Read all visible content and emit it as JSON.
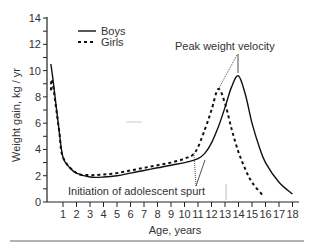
{
  "chart_data": {
    "type": "line",
    "title": "",
    "xlabel": "Age, years",
    "ylabel": "Weight gain, kg / yr",
    "xlim": [
      0,
      18
    ],
    "ylim": [
      0,
      14
    ],
    "x_ticks": [
      "1",
      "2",
      "3",
      "4",
      "5",
      "6",
      "7",
      "8",
      "9",
      "10",
      "11",
      "12",
      "13",
      "14",
      "15",
      "16",
      "17",
      "18"
    ],
    "y_ticks": [
      "0",
      "2",
      "4",
      "6",
      "8",
      "10",
      "12",
      "14"
    ],
    "grid": false,
    "legend_position": "upper-left",
    "series": [
      {
        "name": "Boys",
        "style": "solid",
        "color": "#111111",
        "x": [
          0.1,
          0.3,
          0.7,
          1,
          1.5,
          2,
          3,
          4,
          5,
          6,
          7,
          8,
          9,
          10,
          11,
          11.5,
          12,
          12.5,
          13,
          13.5,
          14,
          14.5,
          15,
          15.5,
          16,
          17,
          18
        ],
        "y": [
          10.5,
          9.0,
          5.5,
          3.4,
          2.6,
          2.2,
          1.9,
          1.9,
          2.0,
          2.2,
          2.4,
          2.6,
          2.8,
          3.0,
          3.3,
          3.7,
          4.5,
          5.7,
          7.2,
          8.8,
          9.6,
          8.2,
          6.0,
          4.3,
          3.0,
          1.5,
          0.6
        ]
      },
      {
        "name": "Girls",
        "style": "dashed",
        "color": "#111111",
        "x": [
          0.1,
          0.2,
          0.7,
          1,
          2,
          3,
          4,
          5,
          6,
          7,
          8,
          9,
          10,
          10.8,
          11.5,
          12,
          12.5,
          13,
          13.5,
          14,
          14.5,
          15,
          15.8
        ],
        "y": [
          8.5,
          9.2,
          5.5,
          3.4,
          2.2,
          2.05,
          2.1,
          2.2,
          2.4,
          2.6,
          2.8,
          3.0,
          3.3,
          3.8,
          5.5,
          7.0,
          8.6,
          7.5,
          5.5,
          3.8,
          2.5,
          1.5,
          0.5
        ]
      }
    ],
    "annotations": [
      {
        "text": "Peak weight velocity",
        "points_to": [
          {
            "series": "Girls",
            "x": 12.5,
            "y": 8.6
          },
          {
            "series": "Boys",
            "x": 14,
            "y": 9.6
          }
        ]
      },
      {
        "text": "Initiation of adolescent spurt",
        "points_to": [
          {
            "series": "Girls",
            "x": 10.8,
            "y": 3.8
          },
          {
            "series": "Boys",
            "x": 11.5,
            "y": 3.2
          }
        ]
      }
    ]
  },
  "legend": {
    "boys": "Boys",
    "girls": "Girls"
  },
  "axes": {
    "xlabel": "Age, years",
    "ylabel": "Weight gain, kg / yr",
    "x_ticks": [
      "1",
      "2",
      "3",
      "4",
      "5",
      "6",
      "7",
      "8",
      "9",
      "10",
      "11",
      "12",
      "13",
      "14",
      "15",
      "16",
      "17",
      "18"
    ],
    "y_ticks": [
      "0",
      "2",
      "4",
      "6",
      "8",
      "10",
      "12",
      "14"
    ]
  },
  "annotations": {
    "peak": "Peak weight velocity",
    "initiation": "Initiation of adolescent spurt"
  }
}
